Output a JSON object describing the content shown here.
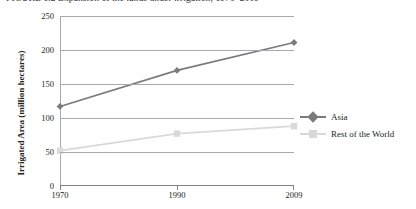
{
  "caption": {
    "figure_label": "FIGURE 1.2",
    "text": "Expansion of the lands under irrigation, 1970–2009",
    "full": "FIGURE 1.2   Expansion of the lands under irrigation, 1970–2009"
  },
  "chart_data": {
    "type": "line",
    "title": "Expansion of the lands under irrigation, 1970–2009",
    "xlabel": "",
    "ylabel": "Irrigated Area (million hectares)",
    "categories": [
      "1970",
      "1990",
      "2009"
    ],
    "x_tick_labels": [
      "1970",
      "1990",
      "2009"
    ],
    "y_tick_labels": [
      "0",
      "50",
      "100",
      "150",
      "200",
      "250"
    ],
    "y_ticks": [
      0,
      50,
      100,
      150,
      200,
      250
    ],
    "ylim": [
      0,
      250
    ],
    "grid": "horizontal",
    "legend_position": "right",
    "series": [
      {
        "name": "Asia",
        "values": [
          117,
          170,
          211
        ],
        "color": "#7b7b7b",
        "marker": "diamond"
      },
      {
        "name": "Rest of the World",
        "values": [
          52,
          77,
          88
        ],
        "color": "#d9d9d9",
        "marker": "square"
      }
    ]
  },
  "colors": {
    "asia": "#7b7b7b",
    "rest_of_world": "#d9d9d9",
    "gridline": "#a7a9ac",
    "axis": "#808285",
    "text": "#231f20",
    "background": "#ffffff"
  }
}
